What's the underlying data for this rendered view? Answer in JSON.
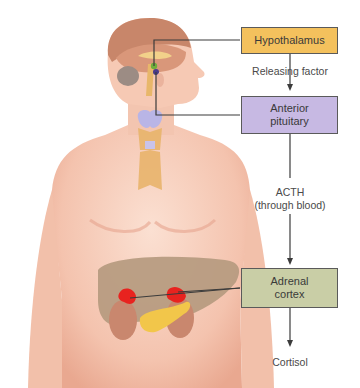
{
  "figure": {
    "boxes": {
      "hypothalamus": {
        "label": "Hypothalamus",
        "color": "#f4c15d"
      },
      "anterior_pituitary": {
        "label": "Anterior pituitary",
        "line1": "Anterior",
        "line2": "pituitary",
        "color": "#c7b9e3"
      },
      "adrenal_cortex": {
        "label": "Adrenal cortex",
        "line1": "Adrenal",
        "line2": "cortex",
        "color": "#c9cea6"
      }
    },
    "arrows": {
      "releasing_factor": "Releasing factor",
      "acth_line1": "ACTH",
      "acth_line2": "(through blood)",
      "cortisol": "Cortisol"
    },
    "colors": {
      "skin": "#f6cbb8",
      "skin_shadow": "#e8a993",
      "brain": "#d9977a",
      "liver": "#b59a7f",
      "kidney": "#c9876e",
      "adrenal": "#e8231f",
      "pancreas": "#f2c64a",
      "thyroid": "#b9b5e6",
      "line": "#3b3b3b"
    }
  }
}
